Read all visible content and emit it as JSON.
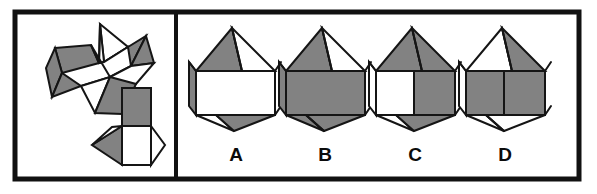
{
  "figure": {
    "type": "spatial-reasoning-puzzle",
    "width": 597,
    "height": 194,
    "background_color": "#ffffff"
  },
  "colors": {
    "shaded_face": "#828282",
    "white_face": "#ffffff",
    "outline": "#151515",
    "frame": "#111111",
    "label_text": "#0b0b0b"
  },
  "frame": {
    "outer": {
      "x": 15,
      "y": 12,
      "width": 564,
      "height": 167
    },
    "divider_x": 176,
    "left_panel_label": "net-panel",
    "right_panel_label": "options-panel"
  },
  "net": {
    "name": "polyhedron-net",
    "faces": [
      {
        "id": "net-face-1",
        "shade": "white",
        "points": "100,24 104,62 128,47"
      },
      {
        "id": "net-face-2",
        "shade": "white",
        "points": "100,24 99,63 104,62"
      },
      {
        "id": "net-face-3",
        "shade": "shaded",
        "points": "104,62 128,47 146,36 131,66"
      },
      {
        "id": "net-face-4",
        "shade": "shaded",
        "points": "131,66 146,36 154,63"
      },
      {
        "id": "net-face-5",
        "shade": "shaded",
        "points": "55,48 91,45 99,63 62,73"
      },
      {
        "id": "net-face-6",
        "shade": "shaded",
        "points": "55,48 62,73 52,97 46,68"
      },
      {
        "id": "net-face-7",
        "shade": "shaded",
        "points": "62,73 52,97 81,86"
      },
      {
        "id": "net-face-8",
        "shade": "white",
        "points": "91,45 99,63 104,62 128,47 131,66 110,77"
      },
      {
        "id": "net-face-9",
        "shade": "white",
        "points": "81,86 110,77 131,66 154,63 136,84"
      },
      {
        "id": "net-face-10",
        "shade": "white",
        "points": "81,86 110,77 95,113"
      },
      {
        "id": "net-face-11",
        "shade": "shaded",
        "points": "95,113 110,77 136,84 122,114"
      },
      {
        "id": "net-face-12",
        "shade": "shaded",
        "points": "122,88 151,88 151,126 122,126"
      },
      {
        "id": "net-face-13",
        "shade": "white",
        "points": "122,126 151,126 151,165 122,165"
      },
      {
        "id": "net-face-14",
        "shade": "shaded",
        "points": "122,126 122,165 92,145"
      },
      {
        "id": "net-face-15",
        "shade": "white",
        "points": "151,126 165,145 151,165"
      },
      {
        "id": "net-face-16",
        "shade": "white",
        "points": "122,126 92,145 112,127"
      }
    ],
    "extra_edges": [
      "100,24 99,63",
      "122,88 122,114",
      "151,88 151,126"
    ]
  },
  "options": [
    {
      "id": "option-a",
      "label": "A",
      "label_x": 236,
      "label_y": 161,
      "faces": [
        {
          "id": "a-top-left-shaded",
          "shade": "shaded",
          "points": "232,28 196,71 242,71"
        },
        {
          "id": "a-top-right-white",
          "shade": "white",
          "points": "232,28 275,71 242,71"
        },
        {
          "id": "a-upper-left-shaded",
          "shade": "shaded",
          "points": "196,71 189,62 189,106 196,115"
        },
        {
          "id": "a-front-white",
          "shade": "white",
          "points": "196,71 275,71 275,115 196,115"
        },
        {
          "id": "a-bottom-left-white",
          "shade": "white",
          "points": "196,115 234,131 216,115"
        },
        {
          "id": "a-bottom-shaded",
          "shade": "shaded",
          "points": "216,115 234,131 275,115"
        }
      ],
      "extra_edges": [
        "232,28 242,71",
        "196,71 189,62",
        "275,71 281,62",
        "275,115 281,106"
      ]
    },
    {
      "id": "option-b",
      "label": "B",
      "label_x": 325,
      "label_y": 161,
      "faces": [
        {
          "id": "b-top-left-shaded",
          "shade": "shaded",
          "points": "322,28 286,71 332,71"
        },
        {
          "id": "b-top-right-white",
          "shade": "white",
          "points": "322,28 365,71 332,71"
        },
        {
          "id": "b-upper-left-shaded",
          "shade": "shaded",
          "points": "286,71 279,62 279,106 286,115"
        },
        {
          "id": "b-front-shaded",
          "shade": "shaded",
          "points": "286,71 365,71 365,115 286,115"
        },
        {
          "id": "b-bottom-left-shaded",
          "shade": "shaded",
          "points": "286,115 324,131 306,115"
        },
        {
          "id": "b-bottom-shaded",
          "shade": "shaded",
          "points": "306,115 324,131 365,115"
        }
      ],
      "extra_edges": [
        "322,28 332,71",
        "286,71 279,62",
        "365,71 371,62",
        "365,115 371,106",
        "306,115 324,131"
      ]
    },
    {
      "id": "option-c",
      "label": "C",
      "label_x": 415,
      "label_y": 161,
      "faces": [
        {
          "id": "c-top-left-shaded",
          "shade": "shaded",
          "points": "412,28 376,71 422,71"
        },
        {
          "id": "c-top-right-shaded",
          "shade": "shaded",
          "points": "412,28 455,71 422,71"
        },
        {
          "id": "c-upper-left-white",
          "shade": "white",
          "points": "376,71 369,62 369,106 376,115"
        },
        {
          "id": "c-front-left-white",
          "shade": "white",
          "points": "376,71 414,71 414,115 376,115"
        },
        {
          "id": "c-front-right-shaded",
          "shade": "shaded",
          "points": "414,71 455,71 455,115 414,115"
        },
        {
          "id": "c-bottom-left-white",
          "shade": "white",
          "points": "376,115 414,131 396,115"
        },
        {
          "id": "c-bottom-shaded",
          "shade": "shaded",
          "points": "396,115 414,131 455,115"
        }
      ],
      "extra_edges": [
        "412,28 422,71",
        "376,71 369,62",
        "455,71 461,62",
        "455,115 461,106",
        "414,71 414,115"
      ]
    },
    {
      "id": "option-d",
      "label": "D",
      "label_x": 505,
      "label_y": 161,
      "faces": [
        {
          "id": "d-top-left-white",
          "shade": "white",
          "points": "502,28 466,71 512,71"
        },
        {
          "id": "d-top-right-shaded",
          "shade": "shaded",
          "points": "502,28 545,71 512,71"
        },
        {
          "id": "d-upper-left-white",
          "shade": "white",
          "points": "466,71 459,62 459,106 466,115"
        },
        {
          "id": "d-front-shaded",
          "shade": "shaded",
          "points": "466,71 545,71 545,115 466,115"
        },
        {
          "id": "d-bottom-left-white",
          "shade": "white",
          "points": "466,115 504,131 486,115"
        },
        {
          "id": "d-bottom-white",
          "shade": "white",
          "points": "486,115 504,131 545,115"
        }
      ],
      "extra_edges": [
        "502,28 512,71",
        "466,71 459,62",
        "545,71 551,62",
        "545,115 551,106",
        "504,71 504,115",
        "486,115 504,131"
      ]
    }
  ]
}
